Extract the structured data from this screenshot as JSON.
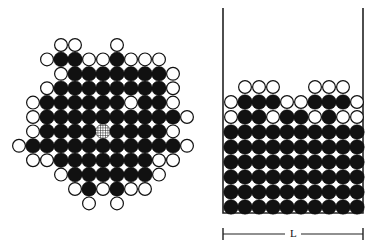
{
  "colors": {
    "filled": "#111111",
    "open_fill": "#ffffff",
    "stroke": "#111111",
    "wall": "#222222",
    "background": "#ffffff"
  },
  "cluster_panel": {
    "description": "Free cluster of particles with a marked (hatched) central particle",
    "grid": {
      "x0": 19,
      "y0": 45,
      "dx": 14,
      "dy": 14.4,
      "radius": 7
    },
    "legend": {
      "F": "filled particle",
      "O": "open (surface) particle",
      "H": "hatched marked particle",
      ".": "empty"
    },
    "rows": [
      "...OO..O.....",
      "..OFFOOFOOO..",
      "...OFFFFFFFO.",
      "..OFFFFFFFFO.",
      ".OFFFFFFOFFO.",
      ".OFFFFFFFFFFO",
      ".OFFFFHFFFFO.",
      "OFFFFFFFFFFFO",
      ".OOFFFFFFFOO.",
      "...OFFFFFFO..",
      "....OFOFOO...",
      ".....O.O....."
    ]
  },
  "container_panel": {
    "description": "Particles settled in a container of width L",
    "walls": {
      "left_x": 223,
      "right_x": 363,
      "top_y": 8,
      "bottom_y": 213
    },
    "grid": {
      "x0": 231,
      "y0": 87,
      "dx": 14,
      "dy": 15,
      "radius": 7
    },
    "rows": [
      ".OOO..OOO.",
      "OFFFOOFFFO",
      "OFFOFFOFOO",
      "FFFFFFFFFF",
      "FFFFFFFFFF",
      "FFFFFFFFFF",
      "FFFFFFFFFF",
      "FFFFFFFFFF",
      "FFFFFFFFFF"
    ],
    "scale_bar": {
      "label": "L",
      "y": 234,
      "x1": 223,
      "x2": 363,
      "tick_height": 12
    }
  }
}
